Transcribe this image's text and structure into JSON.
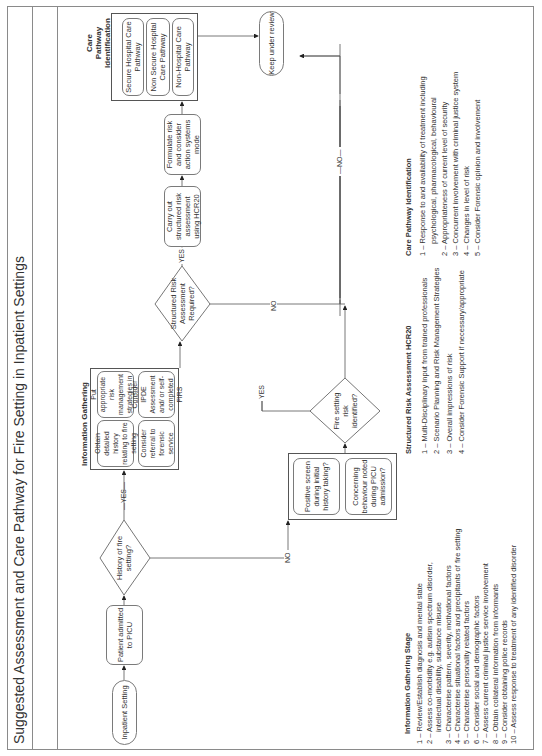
{
  "title": "Suggested Assessment and Care Pathway for Fire Setting in Inpatient Settings",
  "flow": {
    "start": "Inpatient Setting",
    "admitted": "Patient admitted to PICU",
    "history_q": "History of fire setting?",
    "info_group": {
      "title": "Information Gathering",
      "items": [
        "Obtain detailed history relating to fire setting",
        "Put appropriate risk management strategies in place",
        "Consider referral to forensic service",
        "Consider IPDE Assessment and/ or self-completed FIRS"
      ]
    },
    "screen_group": {
      "items": [
        "Positive screen during initial history taking?",
        "Concerning behaviour noted during PICU admission?"
      ]
    },
    "risk_q": "Fire setting risk identified?",
    "structured_q": "Structured Risk Assessment Required?",
    "hcr20": "Carry out structured risk assessment using HCR20",
    "formulate": "Formulate risk and consider action systems mode",
    "care_group": {
      "title": "Care Pathway Identification",
      "items": [
        "Secure Hospital Care Pathway",
        "Non Secure Hospital Care Pathway",
        "Non-Hospital Care Pathway"
      ]
    },
    "review": "Keep under review",
    "labels": {
      "yes": "YES",
      "no": "NO",
      "yes_dash": "—YES—",
      "no_dash": "—NO—"
    }
  },
  "lists": {
    "info": {
      "heading": "Information Gathering Stage",
      "items": [
        "1 – Review/Establish diagnosis and mental state",
        "2 – Assess co-morbidity e.g. autism spectrum disorder,",
        "intellectual disability, substance misuse",
        "3 – Characterise pattern, severity, motivational factors",
        "4 – Characterise situational factors and precipitants of fire setting",
        "5 – Characterise personality related factors",
        "6 – Consider social and demographic factors",
        "7 – Assess current criminal justice service involvement",
        "8 – Obtain collateral information from informants",
        "9 – Consider obtaining police records",
        "10 – Assess response to treatment of any identified disorder"
      ]
    },
    "hcr": {
      "heading": "Structured Risk Assessment HCR20",
      "items": [
        "1 – Multi-Disciplinary Input from trained professionals",
        "2 – Scenario Planning and Risk Management Strategies",
        "3 – Overall impressions of risk",
        "4 – Consider Forensic Support if necessary/appropriate"
      ]
    },
    "care": {
      "heading": "Care Pathway Identification",
      "items": [
        "1 – Response to and availability of treatment including",
        "psychological, pharmacological, behavioural",
        "2 – Appropriateness of current level of security",
        "3 – Concurrent involvement with criminal justice system",
        "4 – Changes in level of risk",
        "5 – Consider Forensic opinion and involvement"
      ]
    }
  }
}
